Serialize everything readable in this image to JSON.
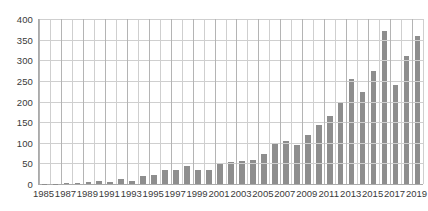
{
  "chart_data": {
    "type": "bar",
    "title": "",
    "subtitle": "",
    "xlabel": "",
    "ylabel": "",
    "grid": true,
    "legend": false,
    "legend_position": "none",
    "bar_color": "#8e8e8e",
    "axis_color": "#aaaaaa",
    "grid_color": "#cfcfcf",
    "ylim": [
      0,
      400
    ],
    "y_ticks": [
      0,
      50,
      100,
      150,
      200,
      250,
      300,
      350,
      400
    ],
    "y_tick_labels": [
      "0",
      "50",
      "100",
      "150",
      "200",
      "250",
      "300",
      "350",
      "400"
    ],
    "x_tick_labels": [
      "1985",
      "1987",
      "1989",
      "1991",
      "1993",
      "1995",
      "1997",
      "1999",
      "2001",
      "2003",
      "2005",
      "2007",
      "2009",
      "2011",
      "2013",
      "2015",
      "2017",
      "2019"
    ],
    "categories": [
      "1985",
      "1986",
      "1987",
      "1988",
      "1989",
      "1990",
      "1991",
      "1992",
      "1993",
      "1994",
      "1995",
      "1996",
      "1997",
      "1998",
      "1999",
      "2000",
      "2001",
      "2002",
      "2003",
      "2004",
      "2005",
      "2006",
      "2007",
      "2008",
      "2009",
      "2010",
      "2011",
      "2012",
      "2013",
      "2014",
      "2015",
      "2016",
      "2017",
      "2018",
      "2019"
    ],
    "values": [
      1,
      1,
      2,
      2,
      4,
      8,
      5,
      12,
      7,
      20,
      21,
      34,
      34,
      43,
      33,
      35,
      51,
      53,
      55,
      58,
      72,
      98,
      105,
      95,
      118,
      143,
      165,
      196,
      255,
      222,
      274,
      372,
      240,
      310,
      358
    ]
  }
}
